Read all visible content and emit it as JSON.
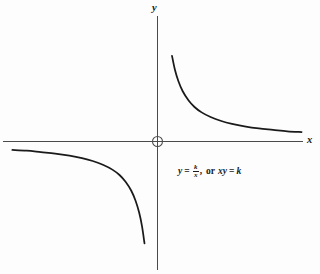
{
  "figure": {
    "background_color": "#fdfdfd",
    "axis_color": "#4a4a4a",
    "curve_color": "#1a1a1a",
    "y_axis_label": "y",
    "x_axis_label": "x",
    "origin_marker": "open-circle"
  },
  "caption": {
    "lhs_variable": "y",
    "equals": "=",
    "fraction_numerator": "k",
    "fraction_denominator": "x",
    "comma": ",",
    "or_word": "or",
    "rhs_expression": "xy",
    "equals2": "=",
    "rhs_constant": "k",
    "full_text": "y = k/x, or xy = k"
  },
  "chart_data": {
    "type": "line",
    "title": "",
    "subtitle": "",
    "xlabel": "x",
    "ylabel": "y",
    "grid": false,
    "legend": null,
    "annotations": [
      {
        "text": "y = k/x, or xy = k",
        "x": 2.4,
        "y": -0.55
      }
    ],
    "axis_origin_px": {
      "x": 157,
      "y": 141
    },
    "x_axis_extent_px": [
      3,
      303
    ],
    "y_axis_extent_px": [
      16,
      270
    ],
    "xlim": [
      -4.1,
      4.3
    ],
    "ylim": [
      -3.6,
      3.5
    ],
    "equation": "y = k/x",
    "constant_k": 1.0,
    "series": [
      {
        "name": "branch-upper-right",
        "quadrant": 1,
        "x": [
          0.42,
          0.5,
          0.6,
          0.72,
          0.88,
          1.05,
          1.25,
          1.5,
          1.8,
          2.1,
          2.45,
          2.85,
          3.25,
          3.65,
          4.05
        ],
        "y": [
          2.38,
          2.0,
          1.67,
          1.39,
          1.14,
          0.95,
          0.8,
          0.67,
          0.56,
          0.48,
          0.41,
          0.35,
          0.31,
          0.27,
          0.25
        ]
      },
      {
        "name": "branch-lower-left",
        "quadrant": 3,
        "x": [
          -4.05,
          -3.65,
          -3.25,
          -2.85,
          -2.45,
          -2.1,
          -1.8,
          -1.5,
          -1.25,
          -1.05,
          -0.88,
          -0.72,
          -0.6,
          -0.5,
          -0.42,
          -0.35
        ],
        "y": [
          -0.25,
          -0.27,
          -0.31,
          -0.35,
          -0.41,
          -0.48,
          -0.56,
          -0.67,
          -0.8,
          -0.95,
          -1.14,
          -1.39,
          -1.67,
          -2.0,
          -2.38,
          -2.86
        ]
      }
    ]
  }
}
